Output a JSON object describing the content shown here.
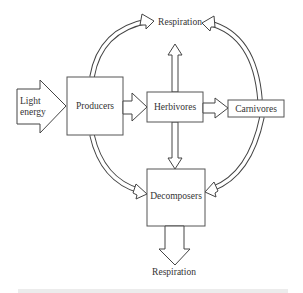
{
  "diagram": {
    "type": "energy-flow-diagram",
    "nodes": {
      "light_energy": {
        "line1": "Light",
        "line2": "energy"
      },
      "producers": {
        "label": "Producers"
      },
      "herbivores": {
        "label": "Herbivores"
      },
      "carnivores": {
        "label": "Carnivores"
      },
      "decomposers": {
        "label": "Decomposers"
      },
      "respiration_top": {
        "label": "Respiration"
      },
      "respiration_bottom": {
        "label": "Respiration"
      }
    },
    "edges": [
      {
        "from": "Light energy",
        "to": "Producers"
      },
      {
        "from": "Producers",
        "to": "Herbivores"
      },
      {
        "from": "Herbivores",
        "to": "Carnivores"
      },
      {
        "from": "Herbivores",
        "to": "Respiration (top)"
      },
      {
        "from": "Herbivores",
        "to": "Decomposers"
      },
      {
        "from": "Producers",
        "to": "Respiration (top)"
      },
      {
        "from": "Carnivores",
        "to": "Respiration (top)"
      },
      {
        "from": "Producers",
        "to": "Decomposers"
      },
      {
        "from": "Carnivores",
        "to": "Decomposers"
      },
      {
        "from": "Decomposers",
        "to": "Respiration (bottom)"
      }
    ],
    "colors": {
      "stroke": "#444444",
      "text": "#333333",
      "background": "#ffffff"
    }
  }
}
